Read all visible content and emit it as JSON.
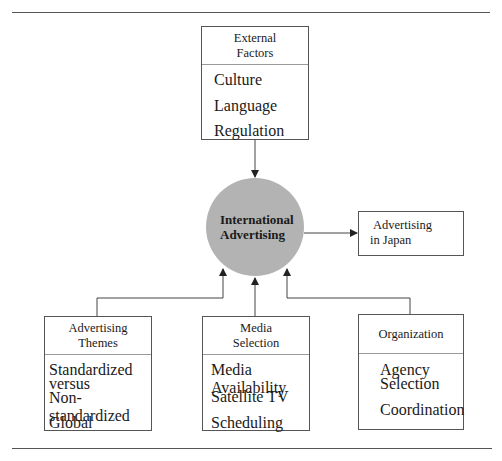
{
  "center": {
    "line1": "International",
    "line2": "Advertising",
    "fill": "#b3b3b3"
  },
  "top_box": {
    "title_line1": "External",
    "title_line2": "Factors",
    "items": [
      "Culture",
      "Language",
      "Regulation"
    ]
  },
  "right_box": {
    "line1": "Advertising",
    "line2": "in Japan"
  },
  "bottom_left_box": {
    "title_line1": "Advertising",
    "title_line2": "Themes",
    "items": [
      "Standardized",
      "versus",
      "Non-standardized",
      "Global"
    ]
  },
  "bottom_middle_box": {
    "title_line1": "Media",
    "title_line2": "Selection",
    "items": [
      "Media Availability",
      "Satellite TV",
      "Scheduling"
    ]
  },
  "bottom_right_box": {
    "title": "Organization",
    "items": [
      "Agency",
      "Selection",
      "Coordination"
    ]
  }
}
